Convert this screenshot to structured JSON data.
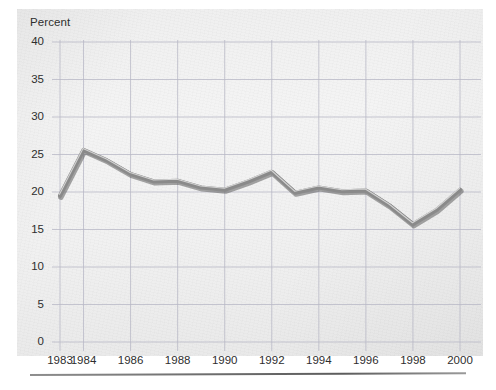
{
  "figure": {
    "name": "percent-line-chart",
    "background_color": "#f1f1f1",
    "page_background": "#ffffff",
    "line_color": "#8a8a8a",
    "line_shadow_color": "#5e5e5e",
    "grid_color": "#b9b9c6",
    "text_color": "#2e2e2e"
  },
  "chart_data": {
    "type": "line",
    "title": "",
    "subtitle": "",
    "xlabel": "",
    "ylabel": "Percent",
    "ylim": [
      0,
      40
    ],
    "xlim": [
      1983,
      2000
    ],
    "grid": true,
    "legend": false,
    "legend_position": "none",
    "y_ticks": [
      "0",
      "5",
      "10",
      "15",
      "20",
      "25",
      "30",
      "35",
      "40"
    ],
    "x_ticks": [
      "1983",
      "1984",
      "1986",
      "1988",
      "1990",
      "1992",
      "1994",
      "1996",
      "1998",
      "2000"
    ],
    "x": [
      1983,
      1984,
      1985,
      1986,
      1987,
      1988,
      1989,
      1990,
      1991,
      1992,
      1993,
      1994,
      1995,
      1996,
      1997,
      1998,
      1999,
      2000
    ],
    "values": [
      19.5,
      25.6,
      24.2,
      22.4,
      21.4,
      21.5,
      20.6,
      20.3,
      21.4,
      22.7,
      19.9,
      20.6,
      20.1,
      20.2,
      18.2,
      15.7,
      17.6,
      20.3
    ],
    "series": [
      {
        "name": "Percent",
        "values": [
          19.5,
          25.6,
          24.2,
          22.4,
          21.4,
          21.5,
          20.6,
          20.3,
          21.4,
          22.7,
          19.9,
          20.6,
          20.1,
          20.2,
          18.2,
          15.7,
          17.6,
          20.3
        ]
      }
    ]
  },
  "rule": {
    "name": "bottom-divider"
  }
}
